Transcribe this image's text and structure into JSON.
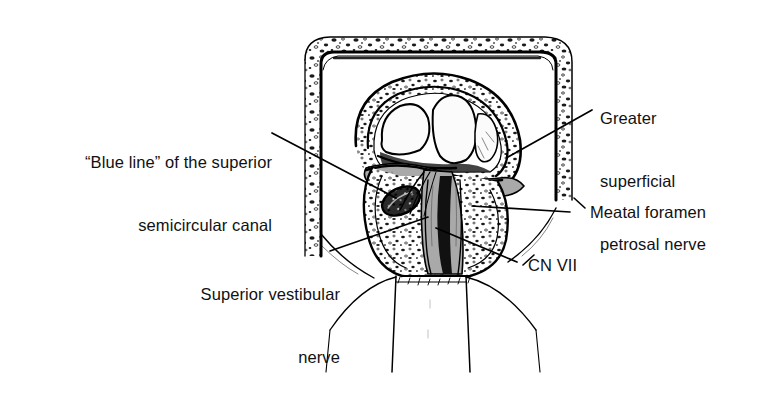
{
  "figure": {
    "kind": "anatomical-line-illustration",
    "background_color": "#ffffff",
    "ink_color": "#000000",
    "nerve_fill_color": "#a9a9a9",
    "bone_fill_color": "#ffffff"
  },
  "labels": {
    "blue_line": {
      "line1": "“Blue line” of the superior",
      "line2": "semicircular canal"
    },
    "greater_superficial_petrosal": {
      "line1": "Greater",
      "line2": "superficial",
      "line3": "petrosal nerve"
    },
    "meatal_foramen": {
      "text": "Meatal foramen"
    },
    "superior_vestibular": {
      "line1": "Superior vestibular",
      "line2": "nerve"
    },
    "cn_vii": {
      "text": "CN VII"
    }
  }
}
